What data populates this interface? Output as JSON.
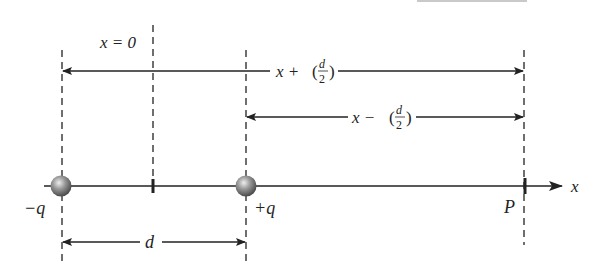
{
  "diagram": {
    "type": "electric-dipole-field-point",
    "labels": {
      "origin": "x = 0",
      "distance_plus": "x + (d/2)",
      "distance_plus_prefix": "x +",
      "distance_minus": "x − (d/2)",
      "distance_minus_prefix": "x −",
      "fraction_num": "d",
      "fraction_den": "2",
      "separation": "d",
      "neg_charge": "−q",
      "pos_charge": "+q",
      "point": "P",
      "axis": "x"
    },
    "positions": {
      "neg_charge_x": 62,
      "origin_x": 153,
      "pos_charge_x": 246,
      "point_x": 524,
      "axis_y": 186
    },
    "colors": {
      "line": "#222222",
      "charge_fill": "#8a8a8a",
      "charge_highlight": "#e0e0e0"
    }
  }
}
